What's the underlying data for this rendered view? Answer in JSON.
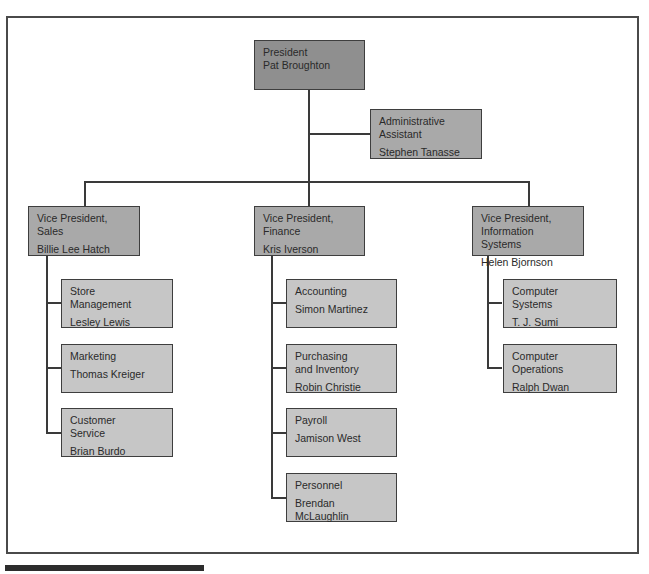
{
  "chart": {
    "president": {
      "title": "President",
      "name": "Pat Broughton"
    },
    "assistant": {
      "title": "Administrative\nAssistant",
      "name": "Stephen Tanasse"
    },
    "vps": [
      {
        "title": "Vice President,\nSales",
        "name": "Billie Lee Hatch",
        "units": [
          {
            "title": "Store\nManagement",
            "name": "Lesley Lewis"
          },
          {
            "title": "Marketing\n",
            "name": "Thomas Kreiger"
          },
          {
            "title": "Customer\nService",
            "name": "Brian Burdo"
          }
        ]
      },
      {
        "title": "Vice President,\nFinance",
        "name": "Kris Iverson",
        "units": [
          {
            "title": "Accounting",
            "name": "Simon Martinez"
          },
          {
            "title": "Purchasing\nand Inventory",
            "name": "Robin Christie"
          },
          {
            "title": "Payroll",
            "name": "Jamison West"
          },
          {
            "title": "Personnel",
            "name": "Brendan\nMcLaughlin"
          }
        ]
      },
      {
        "title": "Vice President,\nInformation Systems",
        "name": "Helen Bjornson",
        "units": [
          {
            "title": "Computer\nSystems",
            "name": "T. J. Sumi"
          },
          {
            "title": "Computer\nOperations",
            "name": "Ralph Dwan"
          }
        ]
      }
    ]
  },
  "colors": {
    "president": "#8f8f8f",
    "vp": "#a9a9a9",
    "unit": "#c6c6c6",
    "line": "#3a3a3a"
  }
}
